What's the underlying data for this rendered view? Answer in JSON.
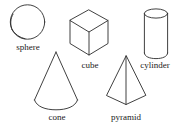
{
  "figure": {
    "background_color": "#ffffff",
    "stroke_color": "#2b2b2b",
    "width": 182,
    "height": 130
  },
  "shapes": [
    {
      "id": "sphere",
      "label": "sphere",
      "icon": "sphere-icon",
      "description": "circle with inner crescent arc"
    },
    {
      "id": "cube",
      "label": "cube",
      "icon": "cube-icon",
      "description": "isometric hexagon with three inner edges"
    },
    {
      "id": "cylinder",
      "label": "cylinder",
      "icon": "cylinder-icon",
      "description": "ellipse top with curved bottom and two sides"
    },
    {
      "id": "cone",
      "label": "cone",
      "icon": "cone-icon",
      "description": "triangle with curved elliptical base"
    },
    {
      "id": "pyramid",
      "label": "pyramid",
      "icon": "pyramid-icon",
      "description": "square pyramid with front vertical edge"
    }
  ]
}
